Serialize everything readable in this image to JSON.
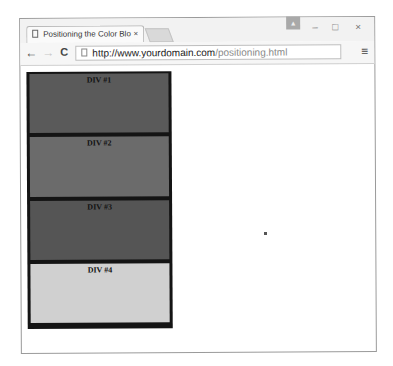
{
  "browser": {
    "tab_title": "Positioning the Color Blo",
    "tab_close": "×",
    "url_host": "http://www.yourdomain.com",
    "url_path": "/positioning.html",
    "nav": {
      "back": "←",
      "forward": "→",
      "reload": "C"
    },
    "menu_icon": "≡",
    "window_controls": {
      "user": "▲",
      "minimize": "–",
      "maximize": "□",
      "close": "×"
    }
  },
  "page": {
    "blocks": [
      {
        "label": "DIV #1",
        "color": "#5a5a5a",
        "height": 59
      },
      {
        "label": "DIV #2",
        "color": "#6b6b6b",
        "height": 60
      },
      {
        "label": "DIV #3",
        "color": "#555555",
        "height": 59
      },
      {
        "label": "DIV #4",
        "color": "#d0d0d0",
        "height": 59
      }
    ],
    "border_color": "#141414"
  }
}
